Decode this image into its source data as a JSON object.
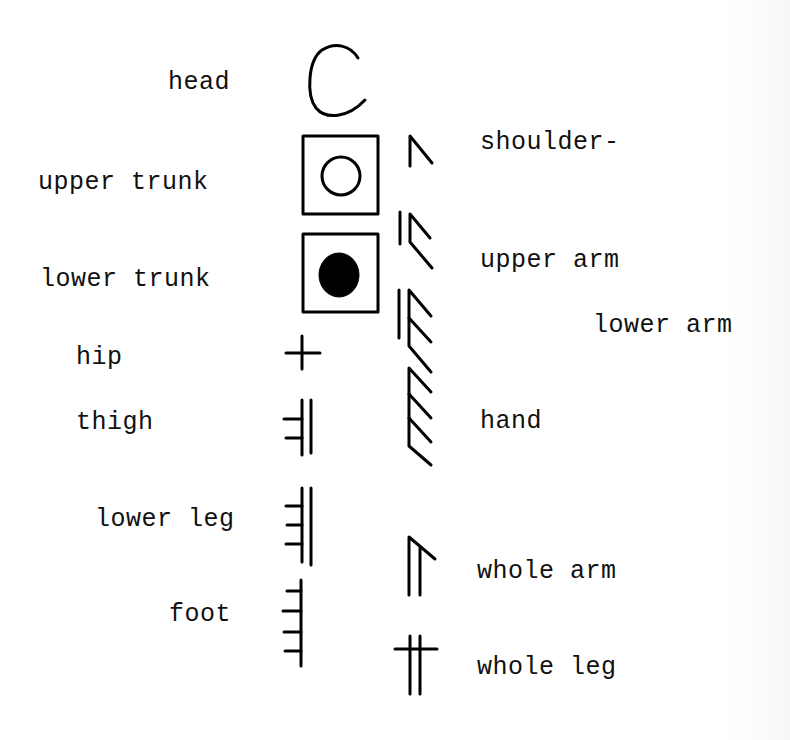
{
  "diagram": {
    "left_column": [
      {
        "id": "head",
        "label": "head",
        "symbol": "head-c-icon"
      },
      {
        "id": "upper-trunk",
        "label": "upper trunk",
        "symbol": "upper-trunk-open-circle-box-icon"
      },
      {
        "id": "lower-trunk",
        "label": "lower trunk",
        "symbol": "lower-trunk-filled-circle-box-icon"
      },
      {
        "id": "hip",
        "label": "hip",
        "symbol": "hip-cross-icon"
      },
      {
        "id": "thigh",
        "label": "thigh",
        "symbol": "thigh-double-line-two-ticks-icon"
      },
      {
        "id": "lower-leg",
        "label": "lower leg",
        "symbol": "lower-leg-double-line-three-ticks-icon"
      },
      {
        "id": "foot",
        "label": "foot",
        "symbol": "foot-single-line-four-ticks-icon"
      }
    ],
    "right_column": [
      {
        "id": "shoulder",
        "label": "shoulder-",
        "symbol": "shoulder-caret-icon"
      },
      {
        "id": "upper-arm",
        "label": "upper arm",
        "symbol": "upper-arm-two-chevrons-icon"
      },
      {
        "id": "lower-arm",
        "label": "lower arm",
        "symbol": "lower-arm-three-chevrons-icon"
      },
      {
        "id": "hand",
        "label": "hand",
        "symbol": "hand-four-chevrons-icon"
      },
      {
        "id": "whole-arm",
        "label": "whole arm",
        "symbol": "whole-arm-double-line-caret-icon"
      },
      {
        "id": "whole-leg",
        "label": "whole leg",
        "symbol": "whole-leg-double-line-cross-icon"
      }
    ]
  }
}
